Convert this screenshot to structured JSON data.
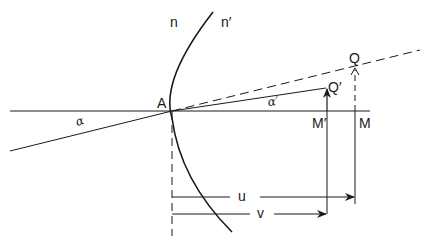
{
  "diagram": {
    "labels": {
      "n": "n",
      "n_prime": "n′",
      "A": "A",
      "Q": "Q",
      "Q_prime": "Q′",
      "M": "M",
      "M_prime": "M′",
      "u": "u",
      "v": "v",
      "alpha": "α",
      "alpha_prime": "α′"
    },
    "colors": {
      "stroke": "#1a1a1a",
      "background": "#ffffff"
    }
  }
}
